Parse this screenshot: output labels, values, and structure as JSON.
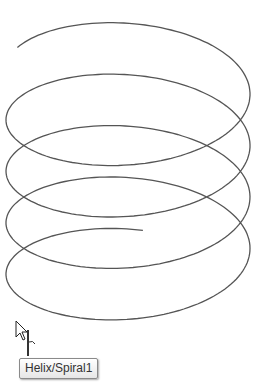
{
  "viewport": {
    "background": "#ffffff",
    "curve_color": "#555555",
    "helix": {
      "center_x": 128,
      "radius_x": 122,
      "radius_y": 58,
      "start_center_y": 72,
      "end_center_y": 288,
      "turns": 4.2,
      "start_angle_deg": 205
    }
  },
  "cursor": {
    "type": "arrow-with-helix-marker"
  },
  "tooltip": {
    "text": "Helix/Spiral1"
  }
}
